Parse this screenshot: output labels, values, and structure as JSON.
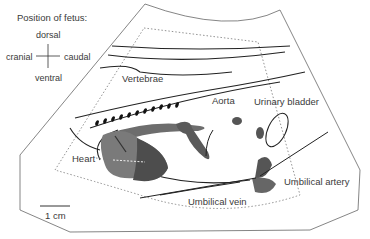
{
  "orientation": {
    "title": "Position of fetus:",
    "dorsal": "dorsal",
    "ventral": "ventral",
    "cranial": "cranial",
    "caudal": "caudal"
  },
  "labels": {
    "vertebrae": "Vertebrae",
    "aorta": "Aorta",
    "urinary_bladder": "Urinary bladder",
    "heart": "Heart",
    "umbilical_vein": "Umbilical vein",
    "umbilical_artery": "Umbilical artery"
  },
  "scale_bar": {
    "label": "1 cm"
  },
  "colors": {
    "outline": "#555555",
    "line": "#222222",
    "organ_light": "#7a7a7a",
    "organ_dark": "#4a4a4a",
    "dotted": "#777777"
  }
}
